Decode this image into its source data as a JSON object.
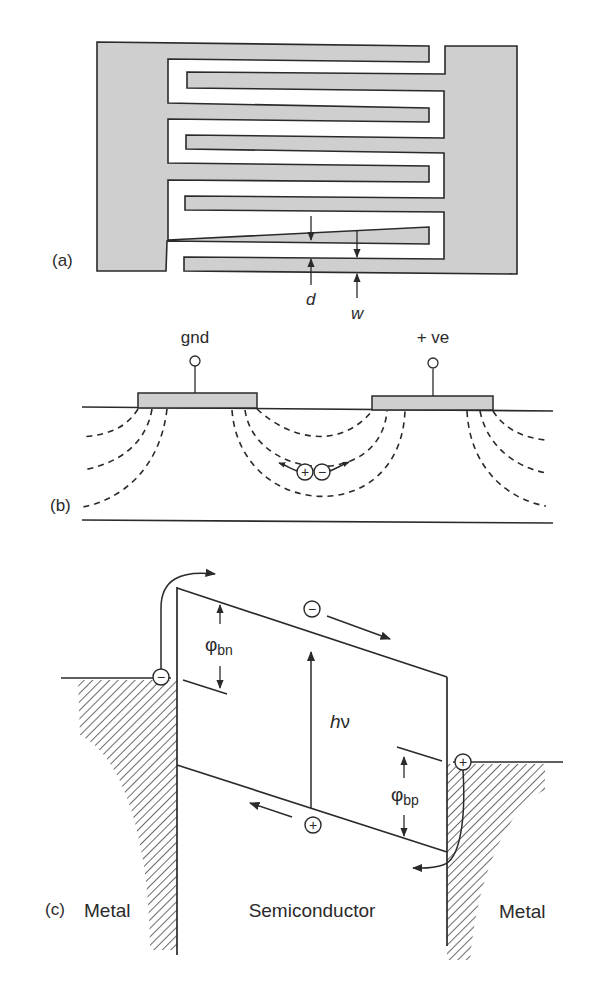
{
  "figure": {
    "panels": [
      {
        "id": "a",
        "label": "(a)",
        "title": "Interdigitated electrode (top view)",
        "dimension_labels": {
          "gap": "d",
          "finger_width": "w"
        }
      },
      {
        "id": "b",
        "label": "(b)",
        "title": "Cross-section with electric field lines",
        "terminals": {
          "left": "gnd",
          "right": "+ ve"
        },
        "carriers": {
          "hole": "+",
          "electron": "−"
        }
      },
      {
        "id": "c",
        "label": "(c)",
        "title": "Metal–semiconductor–metal band diagram",
        "regions": {
          "left": "Metal",
          "center": "Semiconductor",
          "right": "Metal"
        },
        "barriers": {
          "electron": {
            "symbol": "φ",
            "subscript": "bn"
          },
          "hole": {
            "symbol": "φ",
            "subscript": "bp"
          }
        },
        "photon": {
          "h": "h",
          "nu": "ν"
        },
        "carriers": {
          "electron": "−",
          "hole": "+"
        }
      }
    ],
    "colors": {
      "electrode_fill": "#cfcfcf",
      "line": "#2a2a2a",
      "background": "#ffffff"
    }
  }
}
